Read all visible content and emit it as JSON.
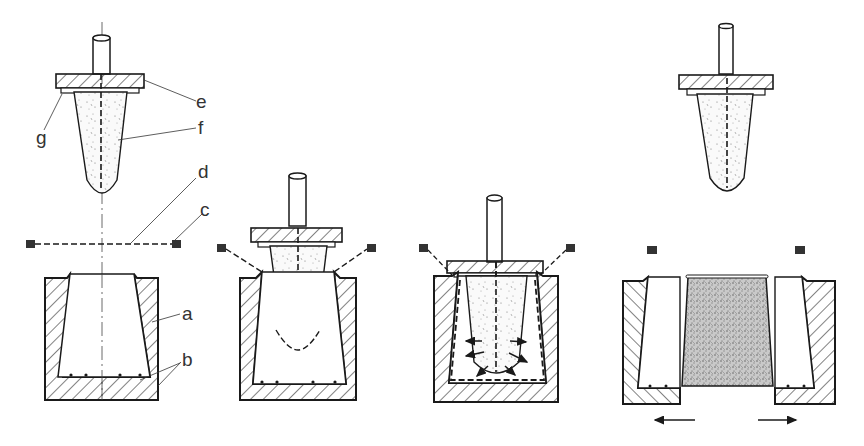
{
  "diagram": {
    "type": "process-sequence",
    "stages": [
      {
        "id": 1,
        "state": "plug raised, sheet clamped above mould"
      },
      {
        "id": 2,
        "state": "plug descends, pre-stretching sheet into mould"
      },
      {
        "id": 3,
        "state": "plug fully down, sheet pulled against mould walls (arrows)"
      },
      {
        "id": 4,
        "state": "plug retracted, mould halves open, formed part removed"
      }
    ],
    "labels": {
      "a": "a",
      "b": "b",
      "c": "c",
      "d": "d",
      "e": "e",
      "f": "f",
      "g": "g"
    },
    "colors": {
      "line": "#1a1a1a",
      "label": "#333333",
      "part_fill": "#bdbdbd"
    }
  }
}
